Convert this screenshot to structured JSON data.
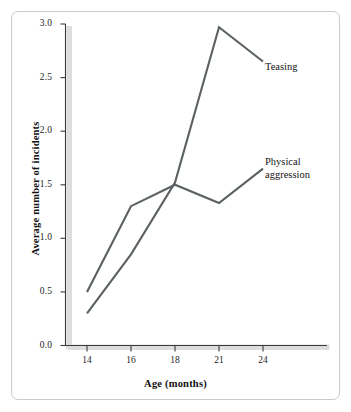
{
  "figure": {
    "background_color": "#ffffff",
    "frame_color": "#c9ccce",
    "axis_color": "#3a3a3a",
    "axis_shadow_color": "#dcdedd"
  },
  "chart_data": {
    "type": "line",
    "title": "",
    "subtitle": "",
    "xlabel": "Age (months)",
    "ylabel": "Average number of incidents",
    "categories": [
      "14",
      "16",
      "18",
      "21",
      "24"
    ],
    "x_tick_labels": [
      "14",
      "16",
      "18",
      "21",
      "24"
    ],
    "y_tick_labels": [
      "0.0",
      "0.5",
      "1.0",
      "1.5",
      "2.0",
      "2.5",
      "3.0"
    ],
    "y_tick_values": [
      0.0,
      0.5,
      1.0,
      1.5,
      2.0,
      2.5,
      3.0
    ],
    "ylim": [
      0.0,
      3.0
    ],
    "grid": false,
    "legend_position": "inline-right-of-line-ends",
    "series": [
      {
        "name": "Teasing",
        "color": "#5b6063",
        "values": [
          0.3,
          0.85,
          1.52,
          2.97,
          2.65
        ]
      },
      {
        "name": "Physical aggression",
        "color": "#5b6063",
        "values": [
          0.5,
          1.3,
          1.5,
          1.33,
          1.65
        ]
      }
    ],
    "annotations": [
      {
        "text": "Teasing",
        "anchor_series": "Teasing"
      },
      {
        "text": "Physical\naggression",
        "anchor_series": "Physical aggression"
      }
    ]
  },
  "labels": {
    "teasing": "Teasing",
    "physical_aggression": "Physical\naggression"
  }
}
